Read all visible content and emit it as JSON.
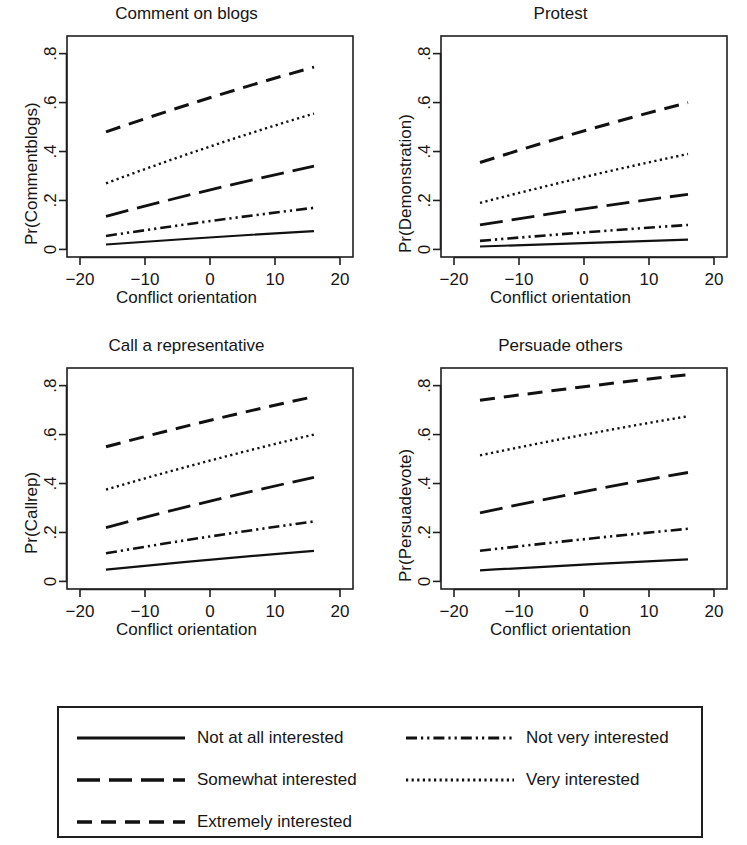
{
  "figure": {
    "xlabel": "Conflict orientation",
    "x_ticks": [
      "-20",
      "-10",
      "0",
      "10",
      "20"
    ],
    "y_ticks": [
      ".8",
      ".6",
      ".4",
      ".2",
      "0"
    ]
  },
  "legend": {
    "items": [
      {
        "label": "Not at all interested",
        "style": "solid"
      },
      {
        "label": "Not very interested",
        "style": "dash-dot-dot"
      },
      {
        "label": "Somewhat interested",
        "style": "long-dash"
      },
      {
        "label": "Very interested",
        "style": "dotted"
      },
      {
        "label": "Extremely interested",
        "style": "dash"
      }
    ]
  },
  "chart_data": [
    {
      "type": "line",
      "title": "Comment on blogs",
      "xlabel": "Conflict orientation",
      "ylabel": "Pr(Commentblogs)",
      "xlim": [
        -22,
        22
      ],
      "ylim": [
        -0.03,
        0.87
      ],
      "x": [
        -16,
        16
      ],
      "xticks": [
        -20,
        -10,
        0,
        10,
        20
      ],
      "yticks": [
        0,
        0.2,
        0.4,
        0.6,
        0.8
      ],
      "grid": false,
      "legend_position": "below-figure",
      "series": [
        {
          "name": "Not at all interested",
          "style": "solid",
          "values": [
            0.02,
            0.075
          ]
        },
        {
          "name": "Not very interested",
          "style": "dash-dot-dot",
          "values": [
            0.055,
            0.17
          ]
        },
        {
          "name": "Somewhat interested",
          "style": "long-dash",
          "values": [
            0.135,
            0.34
          ]
        },
        {
          "name": "Very interested",
          "style": "dotted",
          "values": [
            0.27,
            0.555
          ]
        },
        {
          "name": "Extremely interested",
          "style": "dash",
          "values": [
            0.48,
            0.745
          ]
        }
      ]
    },
    {
      "type": "line",
      "title": "Protest",
      "xlabel": "Conflict orientation",
      "ylabel": "Pr(Demonstration)",
      "xlim": [
        -22,
        22
      ],
      "ylim": [
        -0.03,
        0.87
      ],
      "x": [
        -16,
        16
      ],
      "xticks": [
        -20,
        -10,
        0,
        10,
        20
      ],
      "yticks": [
        0,
        0.2,
        0.4,
        0.6,
        0.8
      ],
      "grid": false,
      "legend_position": "below-figure",
      "series": [
        {
          "name": "Not at all interested",
          "style": "solid",
          "values": [
            0.012,
            0.04
          ]
        },
        {
          "name": "Not very interested",
          "style": "dash-dot-dot",
          "values": [
            0.035,
            0.1
          ]
        },
        {
          "name": "Somewhat interested",
          "style": "long-dash",
          "values": [
            0.1,
            0.225
          ]
        },
        {
          "name": "Very interested",
          "style": "dotted",
          "values": [
            0.19,
            0.39
          ]
        },
        {
          "name": "Extremely interested",
          "style": "dash",
          "values": [
            0.355,
            0.6
          ]
        }
      ]
    },
    {
      "type": "line",
      "title": "Call a representative",
      "xlabel": "Conflict orientation",
      "ylabel": "Pr(Callrep)",
      "xlim": [
        -22,
        22
      ],
      "ylim": [
        -0.03,
        0.87
      ],
      "x": [
        -16,
        16
      ],
      "xticks": [
        -20,
        -10,
        0,
        10,
        20
      ],
      "yticks": [
        0,
        0.2,
        0.4,
        0.6,
        0.8
      ],
      "grid": false,
      "legend_position": "below-figure",
      "series": [
        {
          "name": "Not at all interested",
          "style": "solid",
          "values": [
            0.048,
            0.125
          ]
        },
        {
          "name": "Not very interested",
          "style": "dash-dot-dot",
          "values": [
            0.115,
            0.245
          ]
        },
        {
          "name": "Somewhat interested",
          "style": "long-dash",
          "values": [
            0.22,
            0.425
          ]
        },
        {
          "name": "Very interested",
          "style": "dotted",
          "values": [
            0.375,
            0.6
          ]
        },
        {
          "name": "Extremely interested",
          "style": "dash",
          "values": [
            0.55,
            0.755
          ]
        }
      ]
    },
    {
      "type": "line",
      "title": "Persuade others",
      "xlabel": "Conflict orientation",
      "ylabel": "Pr(Persuadevote)",
      "xlim": [
        -22,
        22
      ],
      "ylim": [
        -0.03,
        0.87
      ],
      "x": [
        -16,
        16
      ],
      "xticks": [
        -20,
        -10,
        0,
        10,
        20
      ],
      "yticks": [
        0,
        0.2,
        0.4,
        0.6,
        0.8
      ],
      "grid": false,
      "legend_position": "below-figure",
      "series": [
        {
          "name": "Not at all interested",
          "style": "solid",
          "values": [
            0.045,
            0.09
          ]
        },
        {
          "name": "Not very interested",
          "style": "dash-dot-dot",
          "values": [
            0.125,
            0.215
          ]
        },
        {
          "name": "Somewhat interested",
          "style": "long-dash",
          "values": [
            0.28,
            0.445
          ]
        },
        {
          "name": "Very interested",
          "style": "dotted",
          "values": [
            0.515,
            0.675
          ]
        },
        {
          "name": "Extremely interested",
          "style": "dash",
          "values": [
            0.74,
            0.845
          ]
        }
      ]
    }
  ]
}
